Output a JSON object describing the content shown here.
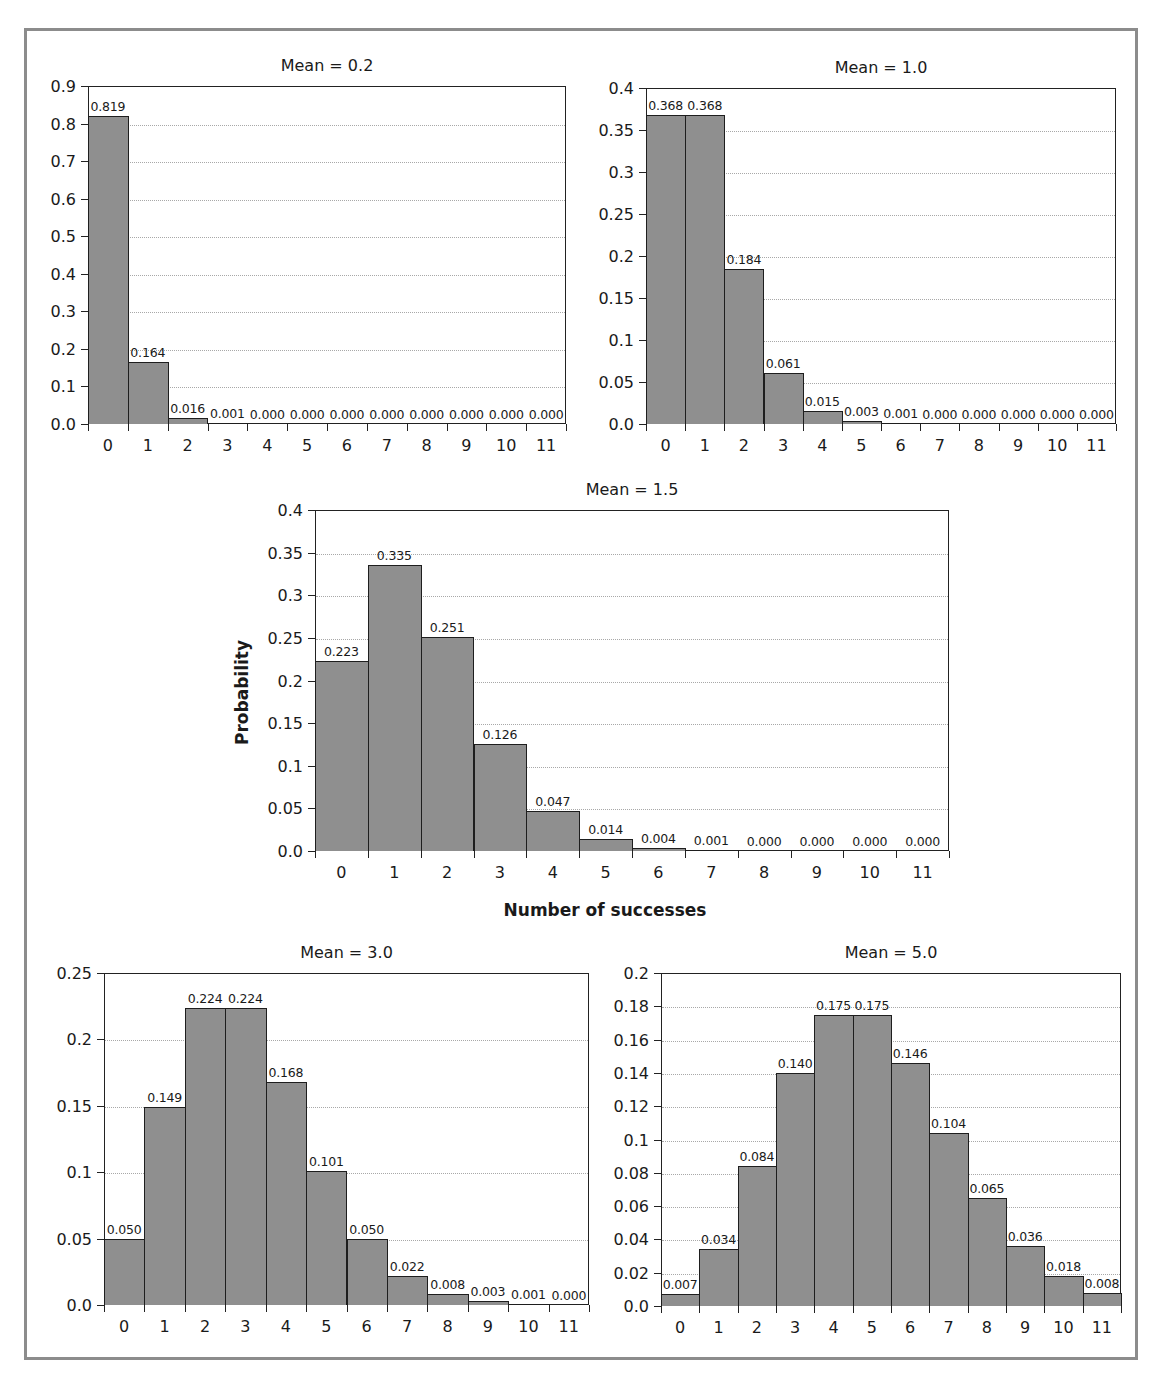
{
  "figure": {
    "y_axis_title": "Probability",
    "x_axis_title": "Number of successes"
  },
  "chart_data": [
    {
      "type": "bar",
      "title": "Mean = 0.2",
      "xlabel": "",
      "ylabel": "",
      "categories": [
        "0",
        "1",
        "2",
        "3",
        "4",
        "5",
        "6",
        "7",
        "8",
        "9",
        "10",
        "11"
      ],
      "values": [
        0.819,
        0.164,
        0.016,
        0.001,
        0.0,
        0.0,
        0.0,
        0.0,
        0.0,
        0.0,
        0.0,
        0.0
      ],
      "value_labels": [
        "0.819",
        "0.164",
        "0.016",
        "0.001",
        "0.000",
        "0.000",
        "0.000",
        "0.000",
        "0.000",
        "0.000",
        "0.000",
        "0.000"
      ],
      "ylim": [
        0,
        0.9
      ],
      "yticks": [
        "0.0",
        "0.1",
        "0.2",
        "0.3",
        "0.4",
        "0.5",
        "0.6",
        "0.7",
        "0.8",
        "0.9"
      ],
      "ytick_values": [
        0,
        0.1,
        0.2,
        0.3,
        0.4,
        0.5,
        0.6,
        0.7,
        0.8,
        0.9
      ],
      "grid": "horizontal dotted",
      "box": {
        "left": 88,
        "top": 86,
        "width": 478,
        "height": 338
      }
    },
    {
      "type": "bar",
      "title": "Mean = 1.0",
      "xlabel": "",
      "ylabel": "",
      "categories": [
        "0",
        "1",
        "2",
        "3",
        "4",
        "5",
        "6",
        "7",
        "8",
        "9",
        "10",
        "11"
      ],
      "values": [
        0.368,
        0.368,
        0.184,
        0.061,
        0.015,
        0.003,
        0.001,
        0.0,
        0.0,
        0.0,
        0.0,
        0.0
      ],
      "value_labels": [
        "0.368",
        "0.368",
        "0.184",
        "0.061",
        "0.015",
        "0.003",
        "0.001",
        "0.000",
        "0.000",
        "0.000",
        "0.000",
        "0.000"
      ],
      "ylim": [
        0,
        0.4
      ],
      "yticks": [
        "0.0",
        "0.05",
        "0.1",
        "0.15",
        "0.2",
        "0.25",
        "0.3",
        "0.35",
        "0.4"
      ],
      "ytick_values": [
        0,
        0.05,
        0.1,
        0.15,
        0.2,
        0.25,
        0.3,
        0.35,
        0.4
      ],
      "grid": "horizontal dotted",
      "box": {
        "left": 646,
        "top": 88,
        "width": 470,
        "height": 336
      }
    },
    {
      "type": "bar",
      "title": "Mean = 1.5",
      "xlabel": "Number of successes",
      "ylabel": "Probability",
      "categories": [
        "0",
        "1",
        "2",
        "3",
        "4",
        "5",
        "6",
        "7",
        "8",
        "9",
        "10",
        "11"
      ],
      "values": [
        0.223,
        0.335,
        0.251,
        0.126,
        0.047,
        0.014,
        0.004,
        0.001,
        0.0,
        0.0,
        0.0,
        0.0
      ],
      "value_labels": [
        "0.223",
        "0.335",
        "0.251",
        "0.126",
        "0.047",
        "0.014",
        "0.004",
        "0.001",
        "0.000",
        "0.000",
        "0.000",
        "0.000"
      ],
      "ylim": [
        0,
        0.4
      ],
      "yticks": [
        "0.0",
        "0.05",
        "0.1",
        "0.15",
        "0.2",
        "0.25",
        "0.3",
        "0.35",
        "0.4"
      ],
      "ytick_values": [
        0,
        0.05,
        0.1,
        0.15,
        0.2,
        0.25,
        0.3,
        0.35,
        0.4
      ],
      "grid": "horizontal dotted",
      "box": {
        "left": 315,
        "top": 510,
        "width": 634,
        "height": 341
      }
    },
    {
      "type": "bar",
      "title": "Mean = 3.0",
      "xlabel": "",
      "ylabel": "",
      "categories": [
        "0",
        "1",
        "2",
        "3",
        "4",
        "5",
        "6",
        "7",
        "8",
        "9",
        "10",
        "11"
      ],
      "values": [
        0.05,
        0.149,
        0.224,
        0.224,
        0.168,
        0.101,
        0.05,
        0.022,
        0.008,
        0.003,
        0.001,
        0.0
      ],
      "value_labels": [
        "0.050",
        "0.149",
        "0.224",
        "0.224",
        "0.168",
        "0.101",
        "0.050",
        "0.022",
        "0.008",
        "0.003",
        "0.001",
        "0.000"
      ],
      "ylim": [
        0,
        0.25
      ],
      "yticks": [
        "0.0",
        "0.05",
        "0.1",
        "0.15",
        "0.2",
        "0.25"
      ],
      "ytick_values": [
        0,
        0.05,
        0.1,
        0.15,
        0.2,
        0.25
      ],
      "grid": "horizontal dotted",
      "box": {
        "left": 104,
        "top": 973,
        "width": 485,
        "height": 332
      }
    },
    {
      "type": "bar",
      "title": "Mean = 5.0",
      "xlabel": "",
      "ylabel": "",
      "categories": [
        "0",
        "1",
        "2",
        "3",
        "4",
        "5",
        "6",
        "7",
        "8",
        "9",
        "10",
        "11"
      ],
      "values": [
        0.007,
        0.034,
        0.084,
        0.14,
        0.175,
        0.175,
        0.146,
        0.104,
        0.065,
        0.036,
        0.018,
        0.008
      ],
      "value_labels": [
        "0.007",
        "0.034",
        "0.084",
        "0.140",
        "0.175",
        "0.175",
        "0.146",
        "0.104",
        "0.065",
        "0.036",
        "0.018",
        "0.008"
      ],
      "ylim": [
        0,
        0.2
      ],
      "yticks": [
        "0.0",
        "0.02",
        "0.04",
        "0.06",
        "0.08",
        "0.1",
        "0.12",
        "0.14",
        "0.16",
        "0.18",
        "0.2"
      ],
      "ytick_values": [
        0,
        0.02,
        0.04,
        0.06,
        0.08,
        0.1,
        0.12,
        0.14,
        0.16,
        0.18,
        0.2
      ],
      "grid": "horizontal dotted",
      "box": {
        "left": 661,
        "top": 973,
        "width": 460,
        "height": 333
      }
    }
  ],
  "colors": {
    "bar_fill": "#8f8f8f",
    "bar_edge": "#1e1e1e",
    "gridline": "#a8a8a8",
    "frame": "#8c8c8c"
  }
}
